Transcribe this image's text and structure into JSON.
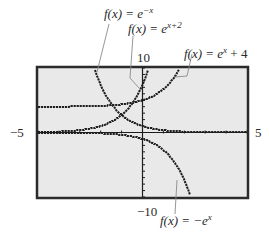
{
  "chart_data": {
    "type": "line",
    "title": "",
    "xlabel": "",
    "ylabel": "",
    "xlim": [
      -5,
      5
    ],
    "ylim": [
      -10,
      10
    ],
    "x_tick_labels": [
      "-5",
      "5"
    ],
    "y_tick_labels": [
      "10",
      "-10"
    ],
    "x_tick_step": 1,
    "y_tick_step": 1,
    "grid": false,
    "series": [
      {
        "name": "f(x) = e^-x",
        "expr": "exp(-x)",
        "label_parts": [
          "f(x) = e",
          "−x"
        ]
      },
      {
        "name": "f(x) = e^(x+2)",
        "expr": "exp(x+2)",
        "label_parts": [
          "f(x) = e",
          "x+2"
        ]
      },
      {
        "name": "f(x) = e^x + 4",
        "expr": "exp(x)+4",
        "label_parts": [
          "f(x) = e",
          "x",
          " + 4"
        ]
      },
      {
        "name": "f(x) = -e^x",
        "expr": "-exp(x)",
        "label_parts": [
          "f(x) = −e",
          "x"
        ]
      }
    ]
  },
  "labels": {
    "x_min": "−5",
    "x_max": "5",
    "y_max": "10",
    "y_min": "−10",
    "f1_base": "f(x) = e",
    "f1_exp": "−x",
    "f2_base": "f(x) = e",
    "f2_exp": "x+2",
    "f3_base": "f(x) = e",
    "f3_exp": "x",
    "f3_tail": " + 4",
    "f4_base": "f(x) = −e",
    "f4_exp": "x"
  },
  "colors": {
    "screen_bg": "#e9e9e9",
    "frame": "#2b2b2b",
    "curve": "#1e1e1e",
    "leader": "#8a8a8a"
  }
}
